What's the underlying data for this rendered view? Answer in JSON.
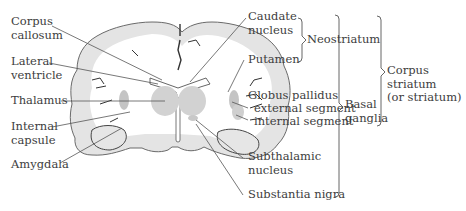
{
  "diagram": {
    "type": "brain-coronal-section",
    "left_labels": [
      {
        "id": "corpus-callosum",
        "lines": [
          "Corpus",
          "callosum"
        ]
      },
      {
        "id": "lateral-ventricle",
        "lines": [
          "Lateral",
          "ventricle"
        ]
      },
      {
        "id": "thalamus",
        "lines": [
          "Thalamus"
        ]
      },
      {
        "id": "internal-capsule",
        "lines": [
          "Internal",
          "capsule"
        ]
      },
      {
        "id": "amygdala",
        "lines": [
          "Amygdala"
        ]
      }
    ],
    "right_labels": [
      {
        "id": "caudate-nucleus",
        "lines": [
          "Caudate",
          "nucleus"
        ]
      },
      {
        "id": "putamen",
        "lines": [
          "Putamen"
        ]
      },
      {
        "id": "globus-pallidus",
        "lines": [
          "Globus pallidus"
        ]
      },
      {
        "id": "external-segment",
        "lines": [
          "external segment"
        ]
      },
      {
        "id": "internal-segment",
        "lines": [
          "internal segment"
        ]
      },
      {
        "id": "subthalamic-nucleus",
        "lines": [
          "Subthalamic",
          "nucleus"
        ]
      },
      {
        "id": "substantia-nigra",
        "lines": [
          "Substantia nigra"
        ]
      }
    ],
    "groups": [
      {
        "id": "neostriatum",
        "label": "Neostriatum",
        "members": [
          "Caudate nucleus",
          "Putamen"
        ]
      },
      {
        "id": "basal-ganglia",
        "label_lines": [
          "Basal",
          "ganglia"
        ],
        "members": [
          "Caudate nucleus",
          "Putamen",
          "Globus pallidus",
          "Subthalamic nucleus",
          "Substantia nigra"
        ]
      },
      {
        "id": "corpus-striatum",
        "label_lines": [
          "Corpus",
          "striatum",
          "(or striatum)"
        ],
        "members": [
          "Caudate nucleus",
          "Putamen",
          "Globus pallidus"
        ]
      }
    ]
  },
  "labels": {
    "corpus_1": "Corpus",
    "corpus_2": "callosum",
    "lateral_1": "Lateral",
    "lateral_2": "ventricle",
    "thalamus": "Thalamus",
    "internal_1": "Internal",
    "internal_2": "capsule",
    "amygdala": "Amygdala",
    "caudate_1": "Caudate",
    "caudate_2": "nucleus",
    "putamen": "Putamen",
    "globus": "Globus pallidus",
    "external": "external segment",
    "internal_seg": "internal segment",
    "subthal_1": "Subthalamic",
    "subthal_2": "nucleus",
    "nigra": "Substantia nigra",
    "neostriatum": "Neostriatum",
    "basal_1": "Basal",
    "basal_2": "ganglia",
    "cs_1": "Corpus",
    "cs_2": "striatum",
    "cs_3": "(or striatum)"
  }
}
